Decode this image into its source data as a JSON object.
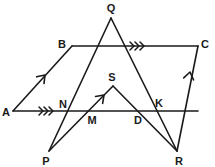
{
  "figure": {
    "canvas": {
      "width": 215,
      "height": 167
    },
    "stroke_color": "#1a1a1a",
    "background_color": "#ffffff",
    "points": [
      {
        "id": "A",
        "label": "A",
        "x": 13,
        "y": 111,
        "label_x": 6,
        "label_y": 112
      },
      {
        "id": "B",
        "label": "B",
        "x": 72,
        "y": 46,
        "label_x": 62,
        "label_y": 44
      },
      {
        "id": "C",
        "label": "C",
        "x": 198,
        "y": 46,
        "label_x": 205,
        "label_y": 44
      },
      {
        "id": "Q",
        "label": "Q",
        "x": 111,
        "y": 18,
        "label_x": 111,
        "label_y": 8
      },
      {
        "id": "S",
        "label": "S",
        "x": 113,
        "y": 86,
        "label_x": 112,
        "label_y": 77
      },
      {
        "id": "N",
        "label": "N",
        "x": 69,
        "y": 111,
        "label_x": 63,
        "label_y": 104
      },
      {
        "id": "M",
        "label": "M",
        "x": 89,
        "y": 111,
        "label_x": 92,
        "label_y": 120
      },
      {
        "id": "D",
        "label": "D",
        "x": 137,
        "y": 111,
        "label_x": 138,
        "label_y": 120
      },
      {
        "id": "K",
        "label": "K",
        "x": 152,
        "y": 111,
        "label_x": 159,
        "label_y": 103
      },
      {
        "id": "P",
        "label": "P",
        "x": 49,
        "y": 151,
        "label_x": 46,
        "label_y": 161
      },
      {
        "id": "R",
        "label": "R",
        "x": 177,
        "y": 151,
        "label_x": 179,
        "label_y": 161
      }
    ],
    "segments": [
      {
        "name": "segment-A-to-C",
        "from": "A",
        "to": "C",
        "path": "M 13 111 L 198 111"
      },
      {
        "name": "segment-B-to-C",
        "from": "B",
        "to": "C",
        "path": "M 72 46 L 198 46"
      },
      {
        "name": "segment-A-to-B",
        "from": "A",
        "to": "B",
        "path": "M 13 111 L 72 46"
      },
      {
        "name": "segment-R-to-C",
        "from": "R",
        "to": "C",
        "path": "M 177 151 L 198 46"
      },
      {
        "name": "segment-P-to-Q",
        "from": "P",
        "to": "Q",
        "path": "M 49 151 L 111 18"
      },
      {
        "name": "segment-Q-to-R",
        "from": "Q",
        "to": "R",
        "path": "M 111 18 L 177 151"
      },
      {
        "name": "segment-P-to-S",
        "from": "P",
        "to": "S",
        "path": "M 49 151 L 113 86"
      },
      {
        "name": "segment-S-to-R",
        "from": "S",
        "to": "R",
        "path": "M 113 86 L 177 151"
      }
    ],
    "markers": {
      "parallel_single_arrows": [
        {
          "name": "arrow-on-AB",
          "on_segment": "segment-A-to-B",
          "x": 45,
          "y": 75,
          "angle": -47.8
        },
        {
          "name": "arrow-on-MS",
          "on_segment": "segment-P-to-S",
          "x": 104,
          "y": 95,
          "angle": -45.4
        },
        {
          "name": "arrow-on-RC",
          "on_segment": "segment-R-to-C",
          "x": 190,
          "y": 72,
          "angle": -78.7
        }
      ],
      "parallel_triple_chevrons": [
        {
          "name": "chevrons-on-AC",
          "on_segment": "segment-A-to-C",
          "x": 50,
          "y": 111,
          "angle": 0,
          "count": 3
        },
        {
          "name": "chevrons-on-BC",
          "on_segment": "segment-B-to-C",
          "x": 141,
          "y": 46,
          "angle": 0,
          "count": 3
        }
      ]
    }
  }
}
